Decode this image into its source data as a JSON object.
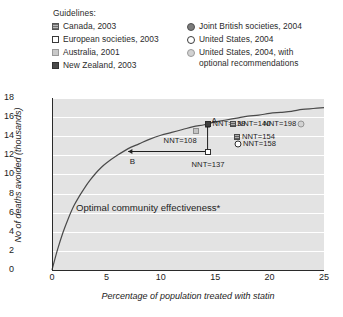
{
  "legend": {
    "title": "Guidelines:",
    "left_items": [
      {
        "label": "Canada, 2003",
        "marker": "hatched-square"
      },
      {
        "label": "European societies, 2003",
        "marker": "white-square"
      },
      {
        "label": "Australia, 2001",
        "marker": "lightgray-square"
      },
      {
        "label": "New Zealand, 2003",
        "marker": "dark-square"
      }
    ],
    "right_items": [
      {
        "label": "Joint British societies, 2004",
        "marker": "filled-circle"
      },
      {
        "label": "United States, 2004",
        "marker": "open-circle"
      },
      {
        "label": "United States, 2004, with\noptional recommendations",
        "marker": "lightgray-circle"
      }
    ]
  },
  "chart_data": {
    "type": "scatter",
    "title": "",
    "xlabel": "Percentage of population treated with statin",
    "ylabel": "No of deaths avoided (thousands)",
    "xlim": [
      0,
      25
    ],
    "ylim": [
      0,
      18
    ],
    "xticks": [
      0,
      5,
      10,
      15,
      20,
      25
    ],
    "yticks": [
      0,
      2,
      4,
      6,
      8,
      10,
      12,
      14,
      16,
      18
    ],
    "grid": "horizontal-white-on-gray",
    "legend_position": "above-plot",
    "curve": {
      "name": "Optimal community effectiveness*",
      "label": "Optimal community effectiveness*",
      "points": [
        [
          0.0,
          0.0
        ],
        [
          0.5,
          2.1
        ],
        [
          1.0,
          3.9
        ],
        [
          1.5,
          5.4
        ],
        [
          2.0,
          6.7
        ],
        [
          2.5,
          7.7
        ],
        [
          3.0,
          8.6
        ],
        [
          3.5,
          9.4
        ],
        [
          4.0,
          10.1
        ],
        [
          4.5,
          10.7
        ],
        [
          5.0,
          11.2
        ],
        [
          6.0,
          12.0
        ],
        [
          7.0,
          12.7
        ],
        [
          8.0,
          13.2
        ],
        [
          9.0,
          13.7
        ],
        [
          10.0,
          14.1
        ],
        [
          11.0,
          14.4
        ],
        [
          12.0,
          14.7
        ],
        [
          13.0,
          15.0
        ],
        [
          14.0,
          15.2
        ],
        [
          15.0,
          15.5
        ],
        [
          16.0,
          15.7
        ],
        [
          17.0,
          15.9
        ],
        [
          18.0,
          16.1
        ],
        [
          19.0,
          16.2
        ],
        [
          20.0,
          16.4
        ],
        [
          21.0,
          16.5
        ],
        [
          22.0,
          16.6
        ],
        [
          23.0,
          16.8
        ],
        [
          24.0,
          16.9
        ],
        [
          25.0,
          17.0
        ]
      ]
    },
    "points": [
      {
        "label": "NNT=108",
        "x": 13.2,
        "y": 14.5,
        "marker": "lightgray-square",
        "label_dx": -32,
        "label_dy": 9
      },
      {
        "label": "NNT=137",
        "x": 14.3,
        "y": 12.4,
        "marker": "white-square",
        "label_dx": -16,
        "label_dy": 12
      },
      {
        "label": "NNT=139",
        "x": 14.3,
        "y": 15.3,
        "marker": "dark-square",
        "label_dx": 5,
        "label_dy": -1
      },
      {
        "label": "NNT=140",
        "x": 16.6,
        "y": 15.3,
        "marker": "hatched-square",
        "label_dx": 5,
        "label_dy": -1
      },
      {
        "label": "NNT=154",
        "x": 17.0,
        "y": 13.9,
        "marker": "hatched-square",
        "label_dx": 5,
        "label_dy": -1
      },
      {
        "label": "NNT=158",
        "x": 17.1,
        "y": 13.2,
        "marker": "open-circle",
        "label_dx": 5,
        "label_dy": -1
      },
      {
        "label": "NNT=198",
        "x": 22.9,
        "y": 15.3,
        "marker": "lightgray-circle",
        "label_dx": -38,
        "label_dy": -1
      }
    ],
    "annotations": [
      {
        "label": "A",
        "type": "vertical-arrow",
        "x": 14.3,
        "y_from": 12.4,
        "y_to": 15.35,
        "label_dx": 4,
        "label_dy": -16
      },
      {
        "label": "B",
        "type": "horizontal-arrow",
        "y": 12.4,
        "x_from": 14.3,
        "x_to": 7.0,
        "label_dx": -38,
        "label_dy": 10
      }
    ]
  }
}
